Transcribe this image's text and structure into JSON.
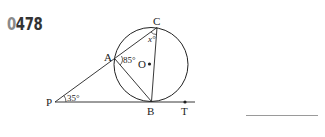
{
  "problem": {
    "number_first": "0",
    "number_rest": "478"
  },
  "diagram": {
    "points": {
      "A": "A",
      "B": "B",
      "C": "C",
      "O": "O",
      "P": "P",
      "T": "T"
    },
    "angles": {
      "angle_P": "35°",
      "angle_A": "85°",
      "angle_C": "x°"
    },
    "colors": {
      "stroke": "#222222",
      "number": "#333333"
    }
  },
  "answer": {
    "blank": ""
  }
}
